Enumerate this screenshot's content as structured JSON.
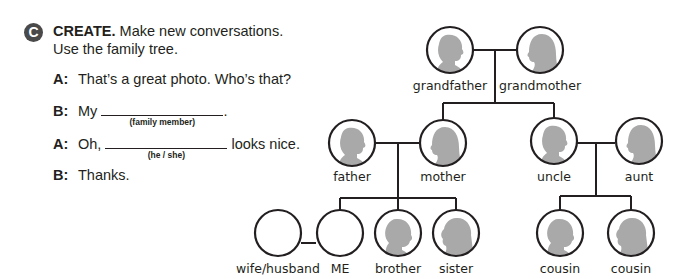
{
  "exercise": {
    "letter": "C",
    "heading": "CREATE.",
    "instruction_line1": "Make new conversations.",
    "instruction_line2": "Use the family tree."
  },
  "conversation": [
    {
      "speaker": "A:",
      "text": "That’s a great photo. Who’s that?"
    },
    {
      "speaker": "B:",
      "before": "My",
      "hint": "(family member)",
      "after": "."
    },
    {
      "speaker": "A:",
      "before": "Oh,",
      "hint": "(he / she)",
      "after": "looks nice."
    },
    {
      "speaker": "B:",
      "text": "Thanks."
    }
  ],
  "family_tree": {
    "grandparents": [
      "grandfather",
      "grandmother"
    ],
    "parents": [
      "father",
      "mother"
    ],
    "uncle_aunt": [
      "uncle",
      "aunt"
    ],
    "my_generation": [
      "wife/husband",
      "ME",
      "brother",
      "sister"
    ],
    "cousins": [
      "cousin",
      "cousin"
    ]
  },
  "colors": {
    "badge": "#4a4a4a",
    "silhouette": "#a9a9a9",
    "line": "#231f20"
  }
}
